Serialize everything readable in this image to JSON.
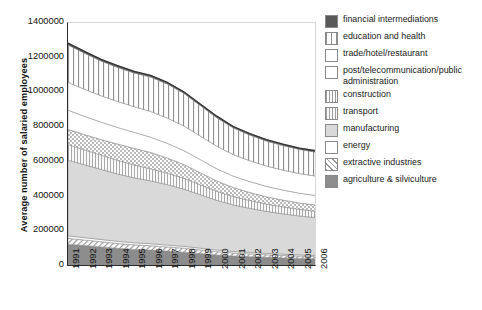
{
  "chart": {
    "type": "area",
    "ylabel": "Average number of salaried employees",
    "xlabel": ""
  },
  "yticks": [
    "0",
    "200000",
    "400000",
    "600000",
    "800000",
    "1000000",
    "1200000",
    "1400000"
  ],
  "xticks": [
    "1991",
    "1992",
    "1993",
    "1994",
    "1995",
    "1996",
    "1997",
    "1998",
    "1999",
    "2000",
    "2001",
    "2002",
    "2003",
    "2004",
    "2005",
    "2006"
  ],
  "legend": {
    "items": [
      {
        "label": "financial intermediations",
        "pattern": "solid-dark",
        "color": "#595959"
      },
      {
        "label": "education and health",
        "pattern": "vertical-wide",
        "color": "#e8e8e8"
      },
      {
        "label": "trade/hotel/restaurant",
        "pattern": "blank",
        "color": "#ffffff"
      },
      {
        "label": "post/telecommunication/public administration",
        "pattern": "blank",
        "color": "#ffffff"
      },
      {
        "label": "construction",
        "pattern": "crosshatch-dots",
        "color": "#dcdcdc"
      },
      {
        "label": "transport",
        "pattern": "vertical-narrow",
        "color": "#efefef"
      },
      {
        "label": "manufacturing",
        "pattern": "solid-light",
        "color": "#d9d9d9"
      },
      {
        "label": "energy",
        "pattern": "blank",
        "color": "#ffffff"
      },
      {
        "label": "extractive industries",
        "pattern": "diagonal",
        "color": "#e2e2e2"
      },
      {
        "label": "agriculture & silviculture",
        "pattern": "solid-mid",
        "color": "#8c8c8c"
      }
    ]
  },
  "chart_data": {
    "type": "area",
    "stacked": true,
    "title": "",
    "xlabel": "",
    "ylabel": "Average number of salaried employees",
    "ylim": [
      0,
      1400000
    ],
    "ytick_step": 200000,
    "grid": false,
    "legend_position": "right",
    "x": [
      1991,
      1992,
      1993,
      1994,
      1995,
      1996,
      1997,
      1998,
      1999,
      2000,
      2001,
      2002,
      2003,
      2004,
      2005,
      2006
    ],
    "categories": [
      "1991",
      "1992",
      "1993",
      "1994",
      "1995",
      "1996",
      "1997",
      "1998",
      "1999",
      "2000",
      "2001",
      "2002",
      "2003",
      "2004",
      "2005",
      "2006"
    ],
    "stack_order_bottom_to_top": [
      "agriculture & silviculture",
      "extractive industries",
      "energy",
      "manufacturing",
      "transport",
      "construction",
      "post/telecommunication/public administration",
      "trade/hotel/restaurant",
      "education and health",
      "financial intermediations"
    ],
    "series": [
      {
        "name": "agriculture & silviculture",
        "values": [
          120000,
          112000,
          104000,
          96000,
          90000,
          86000,
          80000,
          74000,
          66000,
          58000,
          52000,
          48000,
          44000,
          41000,
          38000,
          36000
        ]
      },
      {
        "name": "extractive industries",
        "values": [
          34000,
          32000,
          30000,
          28000,
          26000,
          25000,
          24000,
          23000,
          21000,
          19000,
          17000,
          16000,
          15000,
          14000,
          13000,
          12000
        ]
      },
      {
        "name": "energy",
        "values": [
          14000,
          13500,
          13000,
          12500,
          12000,
          11500,
          11000,
          10500,
          10000,
          9500,
          9000,
          8500,
          8000,
          7800,
          7500,
          7200
        ]
      },
      {
        "name": "manufacturing",
        "values": [
          436000,
          420000,
          404000,
          388000,
          374000,
          362000,
          348000,
          330000,
          308000,
          286000,
          268000,
          254000,
          242000,
          232000,
          224000,
          218000
        ]
      },
      {
        "name": "transport",
        "values": [
          90000,
          86000,
          82000,
          78000,
          74000,
          70000,
          66000,
          62000,
          57000,
          52000,
          48000,
          45000,
          42000,
          40000,
          38000,
          36000
        ]
      },
      {
        "name": "construction",
        "values": [
          88000,
          88000,
          90000,
          94000,
          96000,
          94000,
          88000,
          80000,
          70000,
          60000,
          52000,
          46000,
          42000,
          39000,
          37000,
          36000
        ]
      },
      {
        "name": "post/telecommunication/public administration",
        "values": [
          110000,
          105000,
          100000,
          96000,
          92000,
          88000,
          84000,
          80000,
          75000,
          70000,
          66000,
          63000,
          60000,
          58000,
          56000,
          55000
        ]
      },
      {
        "name": "trade/hotel/restaurant",
        "values": [
          160000,
          156000,
          152000,
          150000,
          148000,
          148000,
          146000,
          142000,
          136000,
          130000,
          124000,
          120000,
          117000,
          115000,
          113000,
          112000
        ]
      },
      {
        "name": "education and health",
        "values": [
          216000,
          208000,
          200000,
          196000,
          194000,
          198000,
          196000,
          188000,
          176000,
          164000,
          154000,
          148000,
          144000,
          141000,
          139000,
          138000
        ]
      },
      {
        "name": "financial intermediations",
        "values": [
          10000,
          10000,
          10000,
          10000,
          10000,
          10000,
          10000,
          9000,
          9000,
          9000,
          8000,
          8000,
          8000,
          8000,
          8000,
          8000
        ]
      }
    ],
    "totals": [
      1278000,
      1230500,
      1185000,
      1148500,
      1116000,
      1092500,
      1053000,
      998500,
      928000,
      857500,
      798000,
      756500,
      722000,
      695800,
      673500,
      658200
    ]
  }
}
